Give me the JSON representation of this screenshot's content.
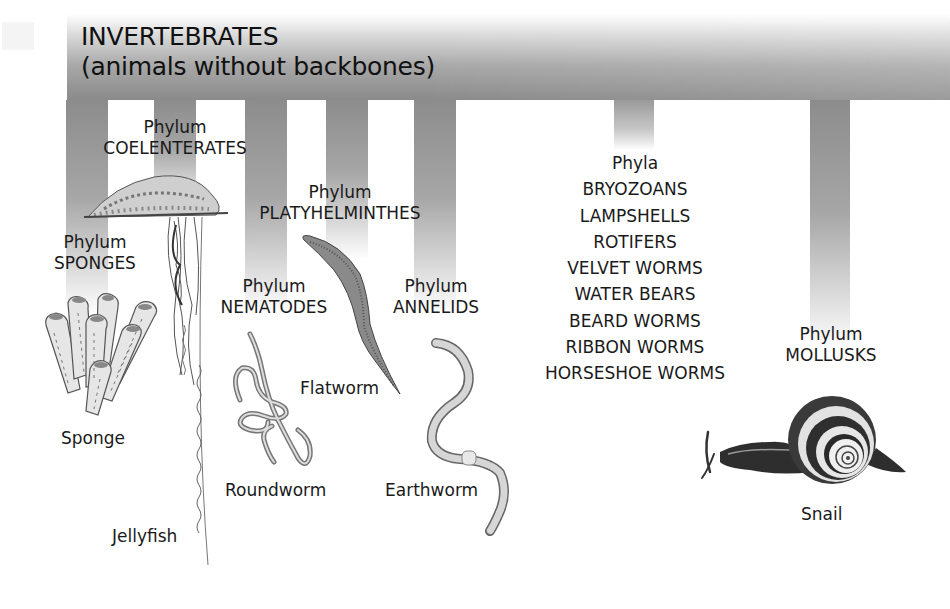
{
  "diagram": {
    "title_line1": "INVERTEBRATES",
    "title_line2": "(animals without backbones)",
    "bar_color": "#8a8a8a",
    "groups": [
      {
        "id": "sponges",
        "rank": "Phylum",
        "name": "SPONGES",
        "example": "Sponge"
      },
      {
        "id": "coelenterates",
        "rank": "Phylum",
        "name": "COELENTERATES",
        "example": "Jellyfish"
      },
      {
        "id": "nematodes",
        "rank": "Phylum",
        "name": "NEMATODES",
        "example": "Roundworm"
      },
      {
        "id": "platyhelminthes",
        "rank": "Phylum",
        "name": "PLATYHELMINTHES",
        "example": "Flatworm"
      },
      {
        "id": "annelids",
        "rank": "Phylum",
        "name": "ANNELIDS",
        "example": "Earthworm"
      },
      {
        "id": "other-phyla",
        "rank": "Phyla",
        "names": [
          "BRYOZOANS",
          "LAMPSHELLS",
          "ROTIFERS",
          "VELVET WORMS",
          "WATER BEARS",
          "BEARD WORMS",
          "RIBBON WORMS",
          "HORSESHOE WORMS"
        ]
      },
      {
        "id": "mollusks",
        "rank": "Phylum",
        "name": "MOLLUSKS",
        "example": "Snail"
      }
    ]
  }
}
